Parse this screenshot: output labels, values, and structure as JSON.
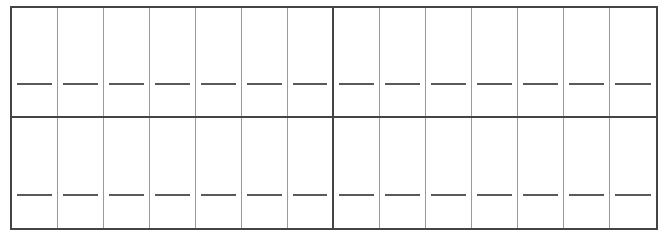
{
  "grid": {
    "rows": 2,
    "columns": 14,
    "groups_per_row": 2,
    "columns_per_group": 7,
    "cell_content": "blank-line",
    "colors": {
      "outer_border": "#444444",
      "inner_border": "#9a9a9a",
      "dash": "#5a5a5a"
    }
  }
}
